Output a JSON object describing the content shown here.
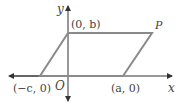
{
  "diagram": {
    "type": "coordinate-parallelogram",
    "axes": {
      "x_label": "x",
      "y_label": "y",
      "origin_label": "O"
    },
    "points": {
      "top_left": {
        "label": "(0, b)",
        "px": [
          68,
          33
        ]
      },
      "top_right": {
        "label": "P",
        "px": [
          152,
          33
        ]
      },
      "bottom_right": {
        "label": "(a, 0)",
        "px": [
          123,
          76
        ]
      },
      "bottom_left": {
        "label": "(−c, 0)",
        "px": [
          40,
          76
        ]
      }
    },
    "colors": {
      "shape_stroke": "#8a8a8a",
      "axis_stroke": "#333333",
      "label_text": "#444444"
    }
  }
}
